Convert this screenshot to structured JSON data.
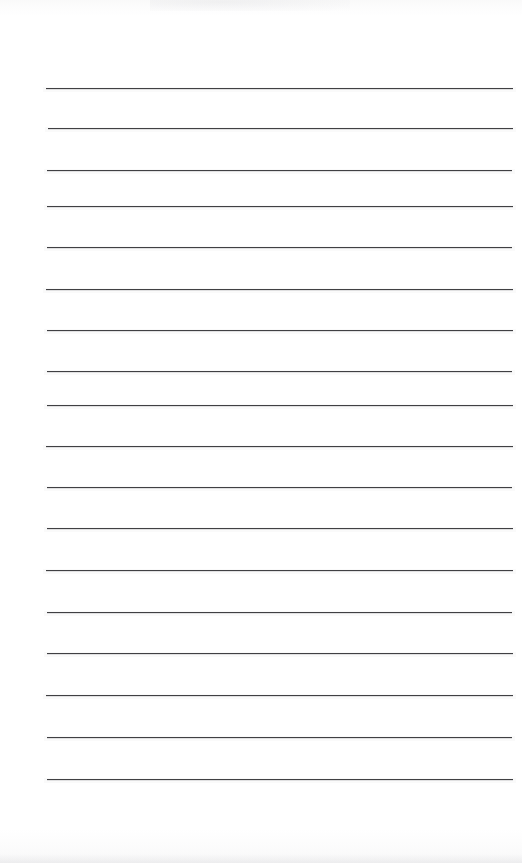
{
  "document": {
    "kind": "scanned-lined-paper",
    "title": "Blank ruled notebook page",
    "page_width": 522,
    "page_height": 863,
    "background_color": "#ffffff",
    "written_text": "",
    "header_text": "",
    "footer_text": "",
    "page_number": ""
  },
  "ruling": {
    "line_color": "#3b3b3f",
    "line_count": 18,
    "left_x": 46,
    "right_x": 513,
    "line_width": 467,
    "average_spacing": 41,
    "lines": [
      {
        "index": 1,
        "y": 88,
        "left": 46,
        "right": 513,
        "thickness": 1.6
      },
      {
        "index": 2,
        "y": 128,
        "left": 48,
        "right": 513,
        "thickness": 1.5
      },
      {
        "index": 3,
        "y": 170,
        "left": 47,
        "right": 512,
        "thickness": 1.5
      },
      {
        "index": 4,
        "y": 206,
        "left": 47,
        "right": 513,
        "thickness": 1.6
      },
      {
        "index": 5,
        "y": 247,
        "left": 47,
        "right": 512,
        "thickness": 1.5
      },
      {
        "index": 6,
        "y": 289,
        "left": 46,
        "right": 513,
        "thickness": 1.6
      },
      {
        "index": 7,
        "y": 330,
        "left": 47,
        "right": 513,
        "thickness": 1.6
      },
      {
        "index": 8,
        "y": 371,
        "left": 47,
        "right": 512,
        "thickness": 1.5
      },
      {
        "index": 9,
        "y": 405,
        "left": 47,
        "right": 513,
        "thickness": 1.6
      },
      {
        "index": 10,
        "y": 446,
        "left": 46,
        "right": 513,
        "thickness": 1.6
      },
      {
        "index": 11,
        "y": 487,
        "left": 47,
        "right": 512,
        "thickness": 1.5
      },
      {
        "index": 12,
        "y": 528,
        "left": 47,
        "right": 513,
        "thickness": 1.6
      },
      {
        "index": 13,
        "y": 570,
        "left": 46,
        "right": 513,
        "thickness": 1.5
      },
      {
        "index": 14,
        "y": 612,
        "left": 47,
        "right": 512,
        "thickness": 1.6
      },
      {
        "index": 15,
        "y": 653,
        "left": 47,
        "right": 513,
        "thickness": 1.5
      },
      {
        "index": 16,
        "y": 695,
        "left": 46,
        "right": 513,
        "thickness": 1.6
      },
      {
        "index": 17,
        "y": 737,
        "left": 47,
        "right": 512,
        "thickness": 1.5
      },
      {
        "index": 18,
        "y": 779,
        "left": 47,
        "right": 513,
        "thickness": 1.7
      }
    ]
  },
  "artifacts": {
    "top_band_label": "scan-shadow-top",
    "top_smudge_label": "scan-smudge-top",
    "bottom_band_label": "scan-shadow-bottom",
    "bottom_edge_label": "scan-edge-bottom"
  }
}
